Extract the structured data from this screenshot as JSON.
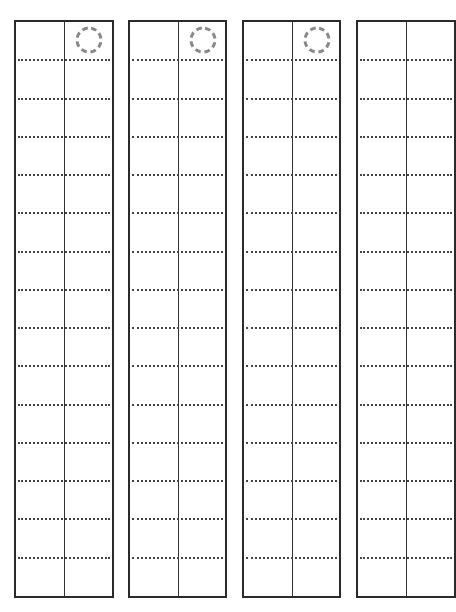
{
  "page": {
    "type": "vertical manuscript writing sheet",
    "background": "#ffffff",
    "line_color": "#2a2a2a",
    "dotted_color": "#444444",
    "marker_color": "#888888"
  },
  "columns": [
    {
      "index": 1,
      "left": 14,
      "width": 100,
      "divider_offset": 48,
      "rows": 15,
      "has_marker": true
    },
    {
      "index": 2,
      "left": 128,
      "width": 99,
      "divider_offset": 48,
      "rows": 15,
      "has_marker": true
    },
    {
      "index": 3,
      "left": 242,
      "width": 99,
      "divider_offset": 48,
      "rows": 15,
      "has_marker": true
    },
    {
      "index": 4,
      "left": 356,
      "width": 100,
      "divider_offset": 48,
      "rows": 15,
      "has_marker": false,
      "cut_off": true
    }
  ],
  "grid": {
    "top": 20,
    "height": 578,
    "rows_per_column": 15,
    "row_height": 38.5
  },
  "marker": {
    "shape": "dashed-circle",
    "radius": 12,
    "stroke_width": 3,
    "dashes": 8
  }
}
